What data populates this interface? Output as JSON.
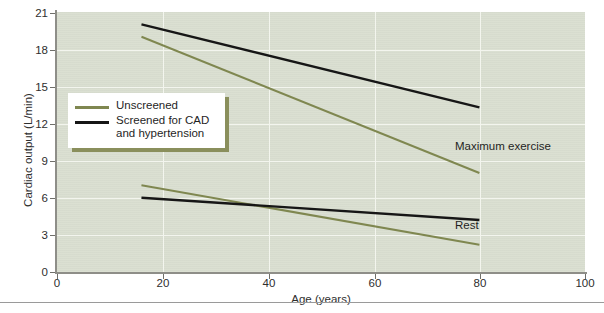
{
  "chart_data": {
    "type": "line",
    "title": "",
    "xlabel": "Age (years)",
    "ylabel": "Cardiac output (L/min)",
    "xlim": [
      0,
      100
    ],
    "ylim": [
      0,
      21
    ],
    "xticks": [
      "0",
      "20",
      "40",
      "60",
      "80",
      "100"
    ],
    "yticks": [
      "0",
      "3",
      "6",
      "9",
      "12",
      "15",
      "18",
      "21"
    ],
    "grid": true,
    "legend_position": "upper-left-inside",
    "plot_background": "#d9ded0",
    "series": [
      {
        "name": "Unscreened",
        "color": "#7f8750",
        "condition": "Maximum exercise",
        "x": [
          16,
          80
        ],
        "values": [
          19.0,
          8.0
        ]
      },
      {
        "name": "Screened for CAD and hypertension",
        "color": "#161616",
        "condition": "Maximum exercise",
        "x": [
          16,
          80
        ],
        "values": [
          20.0,
          13.3
        ]
      },
      {
        "name": "Unscreened",
        "color": "#7f8750",
        "condition": "Rest",
        "x": [
          16,
          80
        ],
        "values": [
          7.0,
          2.2
        ]
      },
      {
        "name": "Screened for CAD and hypertension",
        "color": "#161616",
        "condition": "Rest",
        "x": [
          16,
          80
        ],
        "values": [
          6.0,
          4.2
        ]
      }
    ],
    "annotations": [
      {
        "text": "Maximum exercise",
        "x": 67,
        "y": 10.1
      },
      {
        "text": "Rest",
        "x": 67,
        "y": 4.0
      }
    ]
  },
  "legend": {
    "items": [
      {
        "label": "Unscreened",
        "color": "#7f8750"
      },
      {
        "label": "Screened for CAD\nand hypertension",
        "line1": "Screened for CAD",
        "line2": "and hypertension",
        "color": "#161616"
      }
    ]
  },
  "footer": {
    "text": ""
  }
}
